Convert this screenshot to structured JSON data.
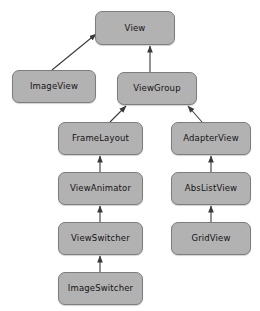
{
  "diagram": {
    "type": "class-hierarchy",
    "canvas": {
      "width": 260,
      "height": 311
    },
    "style": {
      "background": "#ffffff",
      "node_fill": "#b2b2b2",
      "node_border": "#7d7d7d",
      "text_color": "#141414",
      "edge_color": "#3a3a3a"
    },
    "nodes": [
      {
        "id": "view",
        "label": "View",
        "x": 95,
        "y": 11,
        "w": 80,
        "h": 34
      },
      {
        "id": "imageview",
        "label": "ImageView",
        "x": 12,
        "y": 70,
        "w": 84,
        "h": 33
      },
      {
        "id": "viewgroup",
        "label": "ViewGroup",
        "x": 117,
        "y": 72,
        "w": 80,
        "h": 33
      },
      {
        "id": "framelayout",
        "label": "FrameLayout",
        "x": 58,
        "y": 122,
        "w": 85,
        "h": 33
      },
      {
        "id": "adapterview",
        "label": "AdapterView",
        "x": 171,
        "y": 122,
        "w": 80,
        "h": 33
      },
      {
        "id": "viewanimator",
        "label": "ViewAnimator",
        "x": 58,
        "y": 172,
        "w": 85,
        "h": 33
      },
      {
        "id": "abslistview",
        "label": "AbsListView",
        "x": 171,
        "y": 172,
        "w": 80,
        "h": 33
      },
      {
        "id": "viewswitcher",
        "label": "ViewSwitcher",
        "x": 58,
        "y": 222,
        "w": 85,
        "h": 33
      },
      {
        "id": "gridview",
        "label": "GridView",
        "x": 171,
        "y": 222,
        "w": 80,
        "h": 33
      },
      {
        "id": "imageswitcher",
        "label": "ImageSwitcher",
        "x": 58,
        "y": 272,
        "w": 85,
        "h": 33
      }
    ],
    "edges": [
      {
        "id": "imageview-view",
        "from": "imageview",
        "to": "view",
        "x1": 52,
        "y1": 70,
        "x2": 96,
        "y2": 34
      },
      {
        "id": "viewgroup-view",
        "from": "viewgroup",
        "to": "view",
        "x1": 150,
        "y1": 72,
        "x2": 150,
        "y2": 46
      },
      {
        "id": "framelayout-viewgroup",
        "from": "framelayout",
        "to": "viewgroup",
        "x1": 110,
        "y1": 122,
        "x2": 126,
        "y2": 106
      },
      {
        "id": "adapterview-viewgroup",
        "from": "adapterview",
        "to": "viewgroup",
        "x1": 202,
        "y1": 122,
        "x2": 188,
        "y2": 106
      },
      {
        "id": "viewanimator-framelayout",
        "from": "viewanimator",
        "to": "framelayout",
        "x1": 100,
        "y1": 172,
        "x2": 100,
        "y2": 156
      },
      {
        "id": "viewswitcher-viewanimator",
        "from": "viewswitcher",
        "to": "viewanimator",
        "x1": 100,
        "y1": 222,
        "x2": 100,
        "y2": 206
      },
      {
        "id": "imageswitcher-viewswitcher",
        "from": "imageswitcher",
        "to": "viewswitcher",
        "x1": 100,
        "y1": 272,
        "x2": 100,
        "y2": 256
      },
      {
        "id": "abslistview-adapterview",
        "from": "abslistview",
        "to": "adapterview",
        "x1": 211,
        "y1": 172,
        "x2": 211,
        "y2": 156
      },
      {
        "id": "gridview-abslistview",
        "from": "gridview",
        "to": "abslistview",
        "x1": 211,
        "y1": 222,
        "x2": 211,
        "y2": 206
      }
    ]
  }
}
